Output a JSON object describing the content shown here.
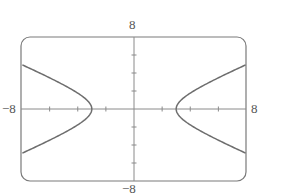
{
  "chart_data": {
    "type": "line",
    "title": "",
    "xlabel": "",
    "ylabel": "",
    "xlim": [
      -8,
      8
    ],
    "ylim": [
      -8,
      8
    ],
    "x_tick_step": 2,
    "y_tick_step": 2,
    "grid": false,
    "axis_labels": {
      "x_min": "−8",
      "x_max": "8",
      "y_min": "−8",
      "y_max": "8"
    },
    "equation": "x^2/9 - y^2/4 = 1",
    "series": [
      {
        "name": "left-branch",
        "x": [
          -8,
          -7,
          -6,
          -5,
          -4,
          -3.5,
          -3
        ],
        "y_upper": [
          4.94,
          4.22,
          3.46,
          2.67,
          1.76,
          1.2,
          0
        ],
        "y_lower": [
          -4.94,
          -4.22,
          -3.46,
          -2.67,
          -1.76,
          -1.2,
          0
        ]
      },
      {
        "name": "right-branch",
        "x": [
          3,
          3.5,
          4,
          5,
          6,
          7,
          8
        ],
        "y_upper": [
          0,
          1.2,
          1.76,
          2.67,
          3.46,
          4.22,
          4.94
        ],
        "y_lower": [
          0,
          -1.2,
          -1.76,
          -2.67,
          -3.46,
          -4.22,
          -4.94
        ]
      }
    ],
    "colors": {
      "frame": "#7a7a7a",
      "axes": "#8a8a8a",
      "curve": "#6e6e6e",
      "labels": "#555555"
    }
  }
}
